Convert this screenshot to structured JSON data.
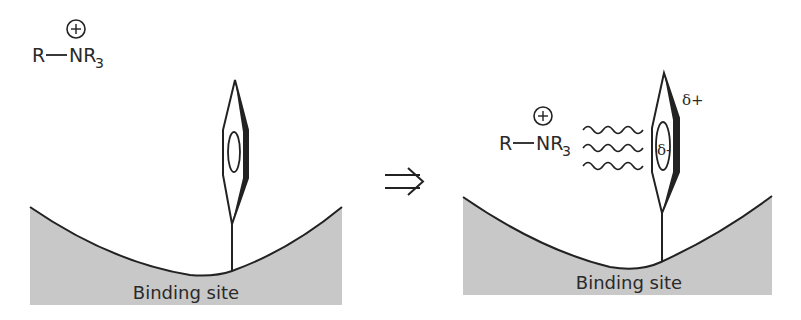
{
  "figure": {
    "colors": {
      "binding_site_fill": "#c8c8c8",
      "stroke": "#222222",
      "background": "#ffffff"
    }
  },
  "left_panel": {
    "ion": {
      "charge_symbol": "+",
      "r_label": "R",
      "n_label": "NR",
      "subscript": "3"
    },
    "binding_site_label": "Binding site",
    "aromatic_ring": "aromatic-ring-edge-on"
  },
  "arrow": {
    "symbol": "⇒",
    "meaning": "implies / leads to"
  },
  "right_panel": {
    "ion": {
      "charge_symbol": "+",
      "r_label": "R",
      "n_label": "NR",
      "subscript": "3"
    },
    "interaction": "wavy-lines",
    "wavy_line_count": 3,
    "partial_charges": {
      "outer": "δ+",
      "inner": "δ-"
    },
    "binding_site_label": "Binding site",
    "aromatic_ring": "aromatic-ring-edge-on"
  }
}
